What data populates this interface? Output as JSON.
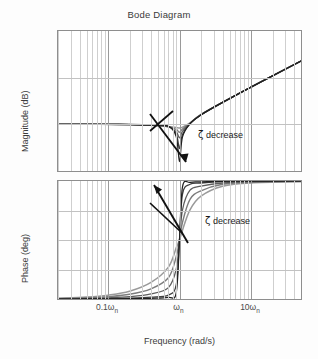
{
  "figure": {
    "title": "Bode Diagram",
    "xlabel": "Frequency (rad/s)"
  },
  "magnitude": {
    "ylabel": "Magnitude (dB)",
    "yticks": [
      "100",
      "50",
      "0",
      "-50"
    ],
    "annotation": "decrease",
    "zeta": "ζ"
  },
  "phase": {
    "ylabel": "Phase (deg)",
    "yticks": [
      "180",
      "135",
      "90",
      "45",
      "0"
    ],
    "annotation": "decrease",
    "zeta": "ζ"
  },
  "xticks": [
    "0.1ω",
    "ω",
    "10ω"
  ],
  "xticks_sub": [
    "n",
    "n",
    "n"
  ],
  "chart_data": {
    "type": "line",
    "title": "Bode Diagram",
    "xlabel": "Frequency (rad/s)",
    "xscale": "log",
    "xtick_labels": [
      "0.1ωn",
      "ωn",
      "10ωn"
    ],
    "xtick_values": [
      0.1,
      1,
      10
    ],
    "xlim": [
      0.02,
      50
    ],
    "grid": true,
    "legend": "none",
    "annotations": [
      {
        "text": "ζ decrease",
        "subplot": "magnitude",
        "arrow": "down-right"
      },
      {
        "text": "ζ decrease",
        "subplot": "phase",
        "arrow": "up-left"
      }
    ],
    "subplots": [
      {
        "name": "magnitude",
        "ylabel": "Magnitude (dB)",
        "ylim": [
          -50,
          100
        ],
        "ytick_values": [
          -50,
          0,
          50,
          100
        ],
        "ytick_labels": [
          "-50",
          "0",
          "50",
          "100"
        ],
        "description": "Inverted second-order response: flat near 0 dB at low frequency, notch dip at resonance omega_n, then +40 dB/decade rise",
        "series": [
          {
            "name": "zeta = 0.5",
            "zeta": 0.5,
            "x": [
              0.02,
              0.05,
              0.1,
              0.2,
              0.4,
              0.7,
              0.9,
              1.0,
              1.1,
              1.4,
              2,
              4,
              10,
              20,
              50
            ],
            "y": [
              0.0,
              0.0,
              -0.1,
              -0.3,
              -1.0,
              -2.3,
              -3.3,
              -4.0,
              -3.0,
              1.5,
              10.5,
              23.5,
              39.9,
              51.9,
              67.9
            ]
          },
          {
            "name": "zeta = 0.3",
            "zeta": 0.3,
            "x": [
              0.02,
              0.05,
              0.1,
              0.2,
              0.4,
              0.7,
              0.9,
              1.0,
              1.1,
              1.4,
              2,
              4,
              10,
              20,
              50
            ],
            "y": [
              0.0,
              0.0,
              -0.1,
              -0.3,
              -0.9,
              -2.6,
              -5.5,
              -8.5,
              -5.0,
              1.2,
              10.4,
              23.5,
              39.9,
              51.9,
              67.9
            ]
          },
          {
            "name": "zeta = 0.15",
            "zeta": 0.15,
            "x": [
              0.02,
              0.05,
              0.1,
              0.2,
              0.4,
              0.7,
              0.9,
              1.0,
              1.1,
              1.4,
              2,
              4,
              10,
              20,
              50
            ],
            "y": [
              0.0,
              0.0,
              -0.1,
              -0.3,
              -0.8,
              -2.4,
              -8.0,
              -14.5,
              -7.5,
              1.0,
              10.3,
              23.5,
              39.9,
              51.9,
              67.9
            ]
          },
          {
            "name": "zeta = 0.05",
            "zeta": 0.05,
            "x": [
              0.02,
              0.05,
              0.1,
              0.2,
              0.4,
              0.7,
              0.9,
              1.0,
              1.1,
              1.4,
              2,
              4,
              10,
              20,
              50
            ],
            "y": [
              0.0,
              0.0,
              0.0,
              -0.2,
              -0.7,
              -2.2,
              -10.5,
              -26.0,
              -11.0,
              0.8,
              10.2,
              23.5,
              39.9,
              51.9,
              67.9
            ]
          },
          {
            "name": "zeta = 0.02",
            "zeta": 0.02,
            "x": [
              0.02,
              0.05,
              0.1,
              0.2,
              0.4,
              0.7,
              0.9,
              1.0,
              1.1,
              1.4,
              2,
              4,
              10,
              20,
              50
            ],
            "y": [
              0.0,
              0.0,
              0.0,
              -0.2,
              -0.6,
              -2.0,
              -13.0,
              -40.0,
              -13.5,
              0.6,
              10.1,
              23.5,
              39.9,
              51.9,
              67.9
            ]
          }
        ]
      },
      {
        "name": "phase",
        "ylabel": "Phase (deg)",
        "ylim": [
          0,
          180
        ],
        "ytick_values": [
          0,
          45,
          90,
          135,
          180
        ],
        "ytick_labels": [
          "0",
          "45",
          "90",
          "135",
          "180"
        ],
        "description": "Phase rises from 0 deg to 180 deg through 90 deg at omega_n; transition sharpens as zeta decreases",
        "series": [
          {
            "name": "zeta = 0.5",
            "zeta": 0.5,
            "x": [
              0.02,
              0.05,
              0.1,
              0.2,
              0.4,
              0.7,
              0.9,
              1.0,
              1.1,
              1.4,
              2,
              4,
              10,
              50
            ],
            "y": [
              1.1,
              2.9,
              5.8,
              11.8,
              25.3,
              48.6,
              78.0,
              90.0,
              105.0,
              136.0,
              157.0,
              172.0,
              177.0,
              179.0
            ]
          },
          {
            "name": "zeta = 0.3",
            "zeta": 0.3,
            "x": [
              0.02,
              0.05,
              0.1,
              0.2,
              0.4,
              0.7,
              0.9,
              1.0,
              1.1,
              1.4,
              2,
              4,
              10,
              50
            ],
            "y": [
              0.7,
              1.7,
              3.5,
              7.1,
              15.6,
              32.5,
              64.5,
              90.0,
              117.0,
              152.0,
              165.0,
              175.0,
              178.0,
              179.5
            ]
          },
          {
            "name": "zeta = 0.15",
            "zeta": 0.15,
            "x": [
              0.02,
              0.05,
              0.1,
              0.2,
              0.4,
              0.7,
              0.9,
              1.0,
              1.1,
              1.4,
              2,
              4,
              10,
              50
            ],
            "y": [
              0.3,
              0.9,
              1.7,
              3.5,
              7.9,
              17.4,
              45.5,
              90.0,
              136.0,
              166.0,
              172.0,
              177.0,
              179.0,
              179.8
            ]
          },
          {
            "name": "zeta = 0.05",
            "zeta": 0.05,
            "x": [
              0.02,
              0.05,
              0.1,
              0.2,
              0.4,
              0.7,
              0.9,
              1.0,
              1.1,
              1.4,
              2,
              4,
              10,
              50
            ],
            "y": [
              0.1,
              0.3,
              0.6,
              1.2,
              2.7,
              6.0,
              21.5,
              90.0,
              160.0,
              175.0,
              177.0,
              179.0,
              179.6,
              179.9
            ]
          },
          {
            "name": "zeta = 0.02",
            "zeta": 0.02,
            "x": [
              0.02,
              0.05,
              0.1,
              0.2,
              0.4,
              0.7,
              0.9,
              1.0,
              1.1,
              1.4,
              2,
              4,
              10,
              50
            ],
            "y": [
              0.05,
              0.1,
              0.2,
              0.5,
              1.1,
              2.4,
              9.5,
              90.0,
              171.0,
              178.0,
              178.8,
              179.5,
              179.8,
              180.0
            ]
          }
        ]
      }
    ]
  }
}
